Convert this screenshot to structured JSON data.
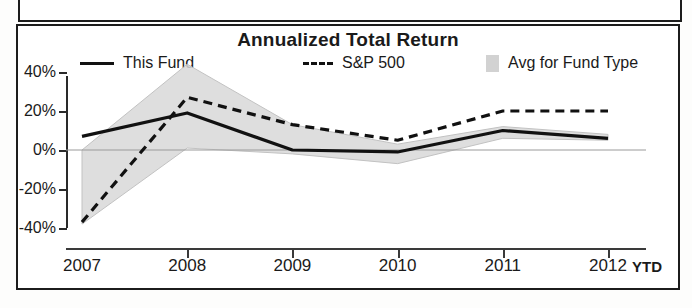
{
  "chart_data": {
    "type": "line",
    "title": "Annualized Total Return",
    "xlabel": "",
    "ylabel": "",
    "x": [
      "2007",
      "2008",
      "2009",
      "2010",
      "2011",
      "2012"
    ],
    "x_suffix_label": "YTD",
    "ylim": [
      -40,
      40
    ],
    "ytick_labels": [
      "40%",
      "20%",
      "0%",
      "-20%",
      "-40%"
    ],
    "ytick_values": [
      40,
      20,
      0,
      -20,
      -40
    ],
    "grid": false,
    "legend_position": "top",
    "series": [
      {
        "name": "This Fund",
        "style": "solid",
        "values": [
          7,
          19,
          0,
          -1,
          10,
          6
        ]
      },
      {
        "name": "S&P 500",
        "style": "dashed",
        "values": [
          -37,
          27,
          13,
          5,
          20,
          20
        ]
      },
      {
        "name": "Avg for Fund Type",
        "style": "band",
        "upper": [
          0,
          44,
          13,
          3,
          12,
          8
        ],
        "lower": [
          -38,
          1,
          -2,
          -7,
          6,
          5
        ]
      }
    ]
  },
  "legend": {
    "items": [
      {
        "label": "This Fund",
        "marker": "solid-line-icon"
      },
      {
        "label": "S&P 500",
        "marker": "dashed-line-icon"
      },
      {
        "label": "Avg for Fund Type",
        "marker": "gray-square-icon"
      }
    ]
  }
}
